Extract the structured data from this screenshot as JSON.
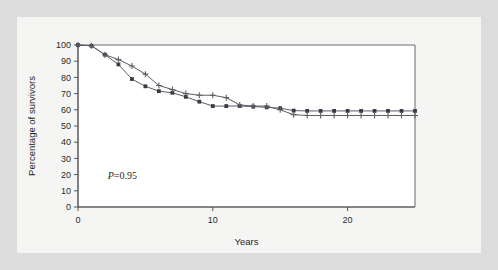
{
  "figure": {
    "background_color": "#dcdcdc",
    "panel_color": "#f5f5f4"
  },
  "annotation": {
    "p_symbol": "P",
    "p_value": "=0.95",
    "full_text": "P=0.95"
  },
  "axes": {
    "x_title": "Years",
    "y_title": "Percentage of survivors",
    "x_ticks": [
      0,
      10,
      20
    ],
    "x_tick_labels": [
      "0",
      "10",
      "20"
    ],
    "y_ticks": [
      0,
      10,
      20,
      30,
      40,
      50,
      60,
      70,
      80,
      90,
      100
    ],
    "y_tick_labels": [
      "0",
      "10",
      "20",
      "30",
      "40",
      "50",
      "60",
      "70",
      "80",
      "90",
      "100"
    ]
  },
  "chart_data": {
    "type": "line",
    "title": "",
    "subtitle": "",
    "xlabel": "Years",
    "ylabel": "Percentage of survivors",
    "xlim": [
      0,
      25
    ],
    "ylim": [
      0,
      100
    ],
    "grid": false,
    "legend": "none",
    "annotations": [
      {
        "text": "P=0.95",
        "x": 2.2,
        "y": 17
      }
    ],
    "series": [
      {
        "name": "squares",
        "marker": "square",
        "color": "#3a3a44",
        "x": [
          0,
          1,
          2,
          3,
          4,
          5,
          6,
          7,
          8,
          9,
          10,
          11,
          12,
          13,
          14,
          15,
          16,
          17,
          18,
          19,
          20,
          21,
          22,
          23,
          24,
          25
        ],
        "y": [
          100,
          99.5,
          94,
          88,
          79,
          74.5,
          71.5,
          70.5,
          68,
          65,
          62.3,
          62.3,
          62.3,
          62,
          61.5,
          61,
          59.5,
          59.3,
          59.3,
          59.3,
          59.3,
          59.3,
          59.3,
          59.3,
          59.3,
          59.3
        ]
      },
      {
        "name": "crosses",
        "marker": "plus",
        "color": "#5d5d66",
        "x": [
          0,
          1,
          2,
          3,
          4,
          5,
          6,
          7,
          8,
          9,
          10,
          11,
          12,
          13,
          14,
          15,
          16,
          17,
          18,
          19,
          20,
          21,
          22,
          23,
          24,
          25
        ],
        "y": [
          100,
          99.5,
          94,
          91,
          87,
          82,
          75,
          72.5,
          70,
          69,
          69,
          67.5,
          63,
          62.3,
          62.3,
          60,
          57,
          56.5,
          56.5,
          56.5,
          56.5,
          56.5,
          56.5,
          56.5,
          56.5,
          56.5
        ]
      }
    ]
  }
}
